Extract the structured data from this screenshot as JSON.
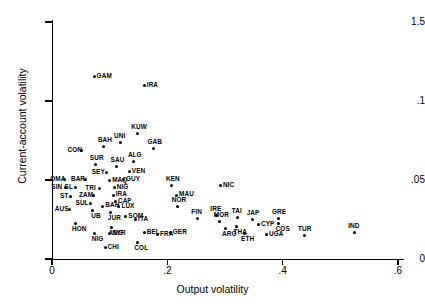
{
  "chart_data": {
    "type": "scatter",
    "title": "",
    "xlabel": "Output volatility",
    "ylabel": "Current-account volatility",
    "xlim": [
      0,
      0.62
    ],
    "ylim": [
      0,
      0.155
    ],
    "grid": false,
    "legend": "none",
    "xticks": [
      "0",
      ".2",
      ".4",
      ".6"
    ],
    "xtick_values": [
      0,
      0.2,
      0.4,
      0.6
    ],
    "yticks": [
      "0",
      ".05",
      ".1",
      "1.5"
    ],
    "ytick_values": [
      0,
      0.05,
      0.1,
      0.15
    ],
    "points": [
      {
        "label": "GAM",
        "x": 0.073,
        "y": 0.1155,
        "lp": "r"
      },
      {
        "label": "IRA",
        "x": 0.16,
        "y": 0.1095,
        "lp": "r"
      },
      {
        "label": "KUW",
        "x": 0.148,
        "y": 0.0795,
        "lp": "t"
      },
      {
        "label": "UNI",
        "x": 0.118,
        "y": 0.0735,
        "lp": "t"
      },
      {
        "label": "BAH",
        "x": 0.09,
        "y": 0.0715,
        "lp": "t"
      },
      {
        "label": "GAB",
        "x": 0.176,
        "y": 0.07,
        "lp": "t"
      },
      {
        "label": "CON",
        "x": 0.052,
        "y": 0.0685,
        "lp": "l"
      },
      {
        "label": "ALG",
        "x": 0.142,
        "y": 0.0615,
        "lp": "t"
      },
      {
        "label": "SUR",
        "x": 0.076,
        "y": 0.0595,
        "lp": "t"
      },
      {
        "label": "SAU",
        "x": 0.112,
        "y": 0.0585,
        "lp": "t"
      },
      {
        "label": "VEN",
        "x": 0.134,
        "y": 0.0555,
        "lp": "r"
      },
      {
        "label": "SEY",
        "x": 0.094,
        "y": 0.0545,
        "lp": "l"
      },
      {
        "label": "OMA",
        "x": 0.022,
        "y": 0.0505,
        "lp": "l"
      },
      {
        "label": "BAR",
        "x": 0.058,
        "y": 0.0505,
        "lp": "l"
      },
      {
        "label": "MAQ",
        "x": 0.1,
        "y": 0.0495,
        "lp": "r"
      },
      {
        "label": "GUY",
        "x": 0.124,
        "y": 0.0505,
        "lp": "r"
      },
      {
        "label": "KEN",
        "x": 0.208,
        "y": 0.0465,
        "lp": "t"
      },
      {
        "label": "SIN",
        "x": 0.024,
        "y": 0.045,
        "lp": "l"
      },
      {
        "label": "SL",
        "x": 0.04,
        "y": 0.045,
        "lp": "l"
      },
      {
        "label": "TRI",
        "x": 0.083,
        "y": 0.0445,
        "lp": "l"
      },
      {
        "label": "NIG",
        "x": 0.108,
        "y": 0.045,
        "lp": "r"
      },
      {
        "label": "NIC",
        "x": 0.292,
        "y": 0.0465,
        "lp": "r"
      },
      {
        "label": "MAU",
        "x": 0.216,
        "y": 0.0405,
        "lp": "r"
      },
      {
        "label": "ST",
        "x": 0.032,
        "y": 0.0395,
        "lp": "l"
      },
      {
        "label": "ZAM",
        "x": 0.072,
        "y": 0.04,
        "lp": "l"
      },
      {
        "label": "IRA2",
        "x": 0.106,
        "y": 0.0405,
        "lp": "r"
      },
      {
        "label": "CAP",
        "x": 0.11,
        "y": 0.0365,
        "lp": "r"
      },
      {
        "label": "SUL",
        "x": 0.066,
        "y": 0.035,
        "lp": "l"
      },
      {
        "label": "BAH2",
        "x": 0.088,
        "y": 0.0335,
        "lp": "r"
      },
      {
        "label": "LUX",
        "x": 0.116,
        "y": 0.033,
        "lp": "r"
      },
      {
        "label": "NOR",
        "x": 0.218,
        "y": 0.033,
        "lp": "t"
      },
      {
        "label": "AUS",
        "x": 0.03,
        "y": 0.0315,
        "lp": "l"
      },
      {
        "label": "UB",
        "x": 0.07,
        "y": 0.031,
        "lp": "b"
      },
      {
        "label": "JUR",
        "x": 0.102,
        "y": 0.0295,
        "lp": "b"
      },
      {
        "label": "SOM",
        "x": 0.128,
        "y": 0.027,
        "lp": "r"
      },
      {
        "label": "ITA",
        "x": 0.145,
        "y": 0.025,
        "lp": "r"
      },
      {
        "label": "FIN",
        "x": 0.252,
        "y": 0.0255,
        "lp": "t"
      },
      {
        "label": "IRE",
        "x": 0.285,
        "y": 0.0275,
        "lp": "t"
      },
      {
        "label": "TAI",
        "x": 0.322,
        "y": 0.0265,
        "lp": "t"
      },
      {
        "label": "JAP",
        "x": 0.348,
        "y": 0.025,
        "lp": "t"
      },
      {
        "label": "GRE",
        "x": 0.392,
        "y": 0.0255,
        "lp": "t"
      },
      {
        "label": "MOR",
        "x": 0.291,
        "y": 0.024,
        "lp": "t"
      },
      {
        "label": "CYP",
        "x": 0.358,
        "y": 0.022,
        "lp": "r"
      },
      {
        "label": "COS",
        "x": 0.393,
        "y": 0.0225,
        "lp": "b"
      },
      {
        "label": "HON",
        "x": 0.04,
        "y": 0.0225,
        "lp": "b"
      },
      {
        "label": "ANG",
        "x": 0.103,
        "y": 0.02,
        "lp": "b"
      },
      {
        "label": "ARG",
        "x": 0.3,
        "y": 0.0195,
        "lp": "b"
      },
      {
        "label": "THA",
        "x": 0.32,
        "y": 0.0205,
        "lp": "b"
      },
      {
        "label": "BEL",
        "x": 0.16,
        "y": 0.0165,
        "lp": "r"
      },
      {
        "label": "FRA",
        "x": 0.183,
        "y": 0.0155,
        "lp": "r"
      },
      {
        "label": "GER",
        "x": 0.205,
        "y": 0.0165,
        "lp": "r"
      },
      {
        "label": "SYR",
        "x": 0.1,
        "y": 0.016,
        "lp": "r"
      },
      {
        "label": "NIG2",
        "x": 0.074,
        "y": 0.016,
        "lp": "b"
      },
      {
        "label": "ETH",
        "x": 0.333,
        "y": 0.016,
        "lp": "b"
      },
      {
        "label": "UGA",
        "x": 0.372,
        "y": 0.0155,
        "lp": "r"
      },
      {
        "label": "TUR",
        "x": 0.437,
        "y": 0.015,
        "lp": "t"
      },
      {
        "label": "IND",
        "x": 0.524,
        "y": 0.017,
        "lp": "t"
      },
      {
        "label": "COL",
        "x": 0.148,
        "y": 0.0105,
        "lp": "b"
      },
      {
        "label": "CHI",
        "x": 0.092,
        "y": 0.0075,
        "lp": "r"
      }
    ]
  }
}
